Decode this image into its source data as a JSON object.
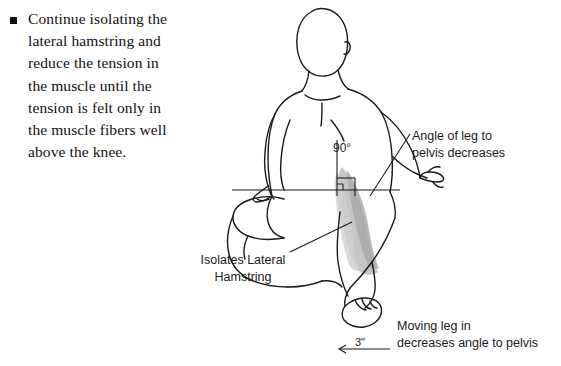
{
  "figure": {
    "type": "anatomical-illustration",
    "title": "",
    "bullet": {
      "marker": "square-bullet",
      "text": "Continue isolating the lateral hamstring and reduce the tension in the muscle until the tension is felt only in the muscle fibers well above the knee."
    },
    "annotations": [
      {
        "name": "angle-of-leg-to-pelvis",
        "text": "Angle of leg to\npelvis decreases"
      },
      {
        "name": "isolates-lateral-hamstring",
        "text": "Isolates Lateral\nHamstring"
      },
      {
        "name": "moving-leg-decreases-angle",
        "text": "Moving leg in\ndecreases angle to pelvis"
      }
    ],
    "measurements": {
      "knee_angle": "90°",
      "movement_distance": "3\""
    },
    "colors": {
      "ink": "#1a1a1a",
      "muscle_shade": "#b9b9b9",
      "muscle_shade_light": "#d4d4d4",
      "background": "#ffffff"
    }
  }
}
